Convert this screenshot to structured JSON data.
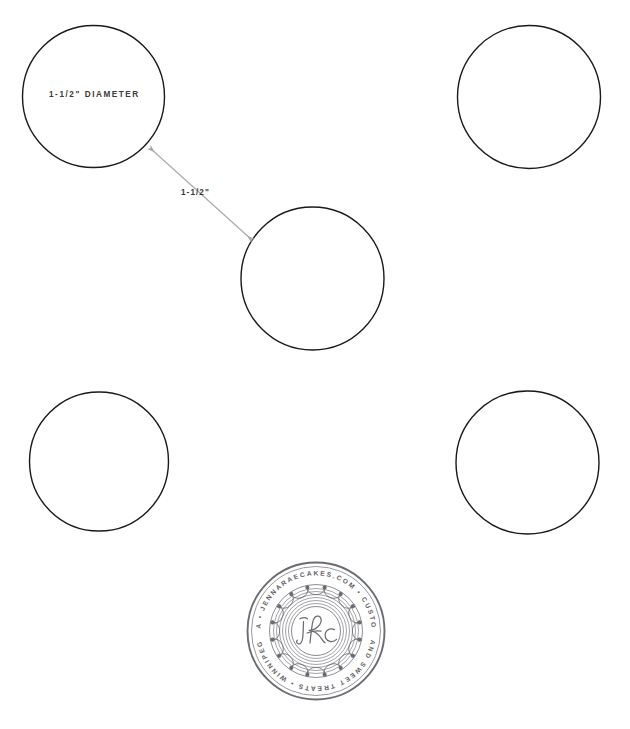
{
  "canvas": {
    "width": 630,
    "height": 729,
    "background_color": "#ffffff"
  },
  "annotations": {
    "diameter_label": "1-1/2\" DIAMETER",
    "spacing_label": "1-1/2\"",
    "text_color": "#3a3a3a",
    "leader_color": "#a9a9a9"
  },
  "shapes": {
    "outline_color": "#1a1a1a",
    "fill_color": "#ffffff",
    "stroke_width": 1.4,
    "circles": [
      {
        "name": "circle-top-left",
        "cx": 93.5,
        "cy": 96.5,
        "r": 71.0
      },
      {
        "name": "circle-top-right",
        "cx": 529.0,
        "cy": 97.0,
        "r": 71.5
      },
      {
        "name": "circle-middle",
        "cx": 312.5,
        "cy": 278.5,
        "r": 71.5
      },
      {
        "name": "circle-bottom-left",
        "cx": 99.0,
        "cy": 461.5,
        "r": 69.5
      },
      {
        "name": "circle-bottom-right",
        "cx": 527.5,
        "cy": 462.5,
        "r": 71.5
      }
    ]
  },
  "leader": {
    "from": {
      "x": 150,
      "y": 148
    },
    "to": {
      "x": 252,
      "y": 240
    },
    "double_headed": true
  },
  "logo": {
    "cx": 316,
    "cy": 631,
    "r": 69,
    "monogram": "JRC",
    "ring_text_top": "MANITOBA • JENNARAECAKES.COM • CUSTOM CAKES",
    "ring_text_bottom": "AND SWEET TREATS • WINNIPEG",
    "ring_text_full": "MANITOBA • JENNARAECAKES.COM • CUSTOM CAKES AND SWEET TREATS • WINNIPEG",
    "ink_color": "#6b6b72"
  }
}
